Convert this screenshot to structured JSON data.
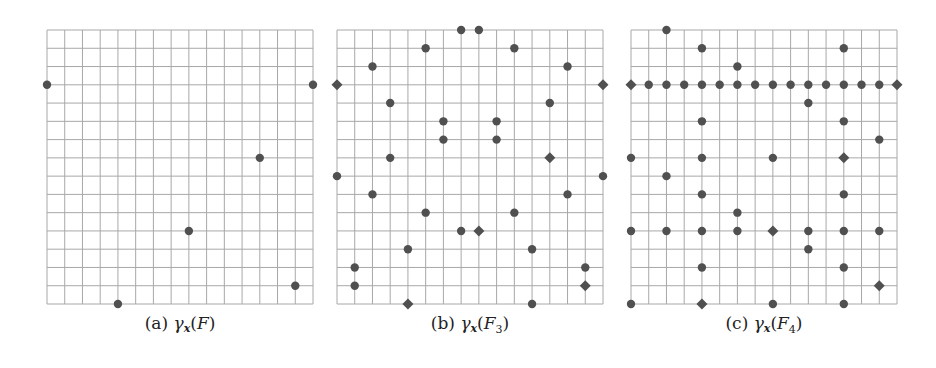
{
  "figure": {
    "grid": {
      "cols": 15,
      "rows": 15,
      "line_color": "#a8a8a8",
      "point_color": "#505050"
    },
    "panels": [
      {
        "id": "a",
        "caption_label": "(a)",
        "caption_func": "γ",
        "caption_sub": "x",
        "caption_arg": "F",
        "caption_arg_sub": "",
        "points": [
          {
            "c": 0,
            "r": 3,
            "shape": "circle"
          },
          {
            "c": 15,
            "r": 3,
            "shape": "circle"
          },
          {
            "c": 12,
            "r": 7,
            "shape": "circle"
          },
          {
            "c": 8,
            "r": 11,
            "shape": "circle"
          },
          {
            "c": 14,
            "r": 14,
            "shape": "circle"
          },
          {
            "c": 4,
            "r": 15,
            "shape": "circle"
          }
        ]
      },
      {
        "id": "b",
        "caption_label": "(b)",
        "caption_func": "γ",
        "caption_sub": "x",
        "caption_arg": "F",
        "caption_arg_sub": "3",
        "points": [
          {
            "c": 7,
            "r": 0,
            "shape": "circle"
          },
          {
            "c": 8,
            "r": 0,
            "shape": "circle"
          },
          {
            "c": 5,
            "r": 1,
            "shape": "circle"
          },
          {
            "c": 10,
            "r": 1,
            "shape": "circle"
          },
          {
            "c": 2,
            "r": 2,
            "shape": "circle"
          },
          {
            "c": 13,
            "r": 2,
            "shape": "circle"
          },
          {
            "c": 0,
            "r": 3,
            "shape": "diamond"
          },
          {
            "c": 15,
            "r": 3,
            "shape": "diamond"
          },
          {
            "c": 3,
            "r": 4,
            "shape": "circle"
          },
          {
            "c": 12,
            "r": 4,
            "shape": "circle"
          },
          {
            "c": 6,
            "r": 5,
            "shape": "circle"
          },
          {
            "c": 9,
            "r": 5,
            "shape": "circle"
          },
          {
            "c": 6,
            "r": 6,
            "shape": "circle"
          },
          {
            "c": 9,
            "r": 6,
            "shape": "circle"
          },
          {
            "c": 3,
            "r": 7,
            "shape": "circle"
          },
          {
            "c": 12,
            "r": 7,
            "shape": "diamond"
          },
          {
            "c": 0,
            "r": 8,
            "shape": "circle"
          },
          {
            "c": 15,
            "r": 8,
            "shape": "circle"
          },
          {
            "c": 2,
            "r": 9,
            "shape": "circle"
          },
          {
            "c": 13,
            "r": 9,
            "shape": "circle"
          },
          {
            "c": 5,
            "r": 10,
            "shape": "circle"
          },
          {
            "c": 10,
            "r": 10,
            "shape": "circle"
          },
          {
            "c": 7,
            "r": 11,
            "shape": "circle"
          },
          {
            "c": 8,
            "r": 11,
            "shape": "diamond"
          },
          {
            "c": 4,
            "r": 12,
            "shape": "circle"
          },
          {
            "c": 11,
            "r": 12,
            "shape": "circle"
          },
          {
            "c": 1,
            "r": 13,
            "shape": "circle"
          },
          {
            "c": 14,
            "r": 13,
            "shape": "circle"
          },
          {
            "c": 1,
            "r": 14,
            "shape": "circle"
          },
          {
            "c": 14,
            "r": 14,
            "shape": "diamond"
          },
          {
            "c": 4,
            "r": 15,
            "shape": "diamond"
          },
          {
            "c": 11,
            "r": 15,
            "shape": "circle"
          }
        ]
      },
      {
        "id": "c",
        "caption_label": "(c)",
        "caption_func": "γ",
        "caption_sub": "x",
        "caption_arg": "F",
        "caption_arg_sub": "4",
        "points": [
          {
            "c": 2,
            "r": 0,
            "shape": "circle"
          },
          {
            "c": 4,
            "r": 1,
            "shape": "circle"
          },
          {
            "c": 12,
            "r": 1,
            "shape": "circle"
          },
          {
            "c": 6,
            "r": 2,
            "shape": "circle"
          },
          {
            "c": 0,
            "r": 3,
            "shape": "diamond"
          },
          {
            "c": 1,
            "r": 3,
            "shape": "circle"
          },
          {
            "c": 2,
            "r": 3,
            "shape": "circle"
          },
          {
            "c": 3,
            "r": 3,
            "shape": "circle"
          },
          {
            "c": 4,
            "r": 3,
            "shape": "circle"
          },
          {
            "c": 5,
            "r": 3,
            "shape": "circle"
          },
          {
            "c": 6,
            "r": 3,
            "shape": "circle"
          },
          {
            "c": 7,
            "r": 3,
            "shape": "circle"
          },
          {
            "c": 8,
            "r": 3,
            "shape": "circle"
          },
          {
            "c": 9,
            "r": 3,
            "shape": "circle"
          },
          {
            "c": 10,
            "r": 3,
            "shape": "circle"
          },
          {
            "c": 11,
            "r": 3,
            "shape": "circle"
          },
          {
            "c": 12,
            "r": 3,
            "shape": "circle"
          },
          {
            "c": 13,
            "r": 3,
            "shape": "circle"
          },
          {
            "c": 14,
            "r": 3,
            "shape": "circle"
          },
          {
            "c": 15,
            "r": 3,
            "shape": "diamond"
          },
          {
            "c": 10,
            "r": 4,
            "shape": "circle"
          },
          {
            "c": 4,
            "r": 5,
            "shape": "circle"
          },
          {
            "c": 12,
            "r": 5,
            "shape": "circle"
          },
          {
            "c": 14,
            "r": 6,
            "shape": "circle"
          },
          {
            "c": 0,
            "r": 7,
            "shape": "circle"
          },
          {
            "c": 4,
            "r": 7,
            "shape": "circle"
          },
          {
            "c": 8,
            "r": 7,
            "shape": "circle"
          },
          {
            "c": 12,
            "r": 7,
            "shape": "diamond"
          },
          {
            "c": 2,
            "r": 8,
            "shape": "circle"
          },
          {
            "c": 4,
            "r": 9,
            "shape": "circle"
          },
          {
            "c": 12,
            "r": 9,
            "shape": "circle"
          },
          {
            "c": 6,
            "r": 10,
            "shape": "circle"
          },
          {
            "c": 0,
            "r": 11,
            "shape": "circle"
          },
          {
            "c": 2,
            "r": 11,
            "shape": "circle"
          },
          {
            "c": 4,
            "r": 11,
            "shape": "circle"
          },
          {
            "c": 6,
            "r": 11,
            "shape": "circle"
          },
          {
            "c": 8,
            "r": 11,
            "shape": "diamond"
          },
          {
            "c": 10,
            "r": 11,
            "shape": "circle"
          },
          {
            "c": 12,
            "r": 11,
            "shape": "circle"
          },
          {
            "c": 14,
            "r": 11,
            "shape": "circle"
          },
          {
            "c": 10,
            "r": 12,
            "shape": "circle"
          },
          {
            "c": 4,
            "r": 13,
            "shape": "circle"
          },
          {
            "c": 12,
            "r": 13,
            "shape": "circle"
          },
          {
            "c": 14,
            "r": 14,
            "shape": "diamond"
          },
          {
            "c": 0,
            "r": 15,
            "shape": "circle"
          },
          {
            "c": 4,
            "r": 15,
            "shape": "diamond"
          },
          {
            "c": 8,
            "r": 15,
            "shape": "circle"
          },
          {
            "c": 12,
            "r": 15,
            "shape": "circle"
          }
        ]
      }
    ]
  }
}
